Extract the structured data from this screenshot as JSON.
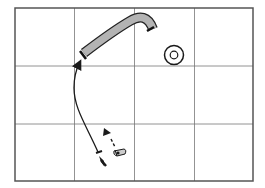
{
  "diagram": {
    "type": "grid-map-with-path",
    "grid": {
      "columns": 4,
      "rows": 3,
      "frame_color": "#555555",
      "line_color": "#777777"
    },
    "elements": [
      {
        "name": "curved-bar",
        "fill": "#b3b3b3",
        "stroke": "#222222"
      },
      {
        "name": "target-circle",
        "rings": 2
      },
      {
        "name": "trajectory-arrow",
        "style": "solid",
        "direction": "up"
      },
      {
        "name": "dashed-arrow",
        "style": "dashed",
        "direction": "up"
      },
      {
        "name": "start-marker"
      },
      {
        "name": "figure-marker"
      }
    ],
    "colors": {
      "background": "#ffffff",
      "ink": "#1a1a1a",
      "bar_fill": "#b3b3b3"
    }
  }
}
